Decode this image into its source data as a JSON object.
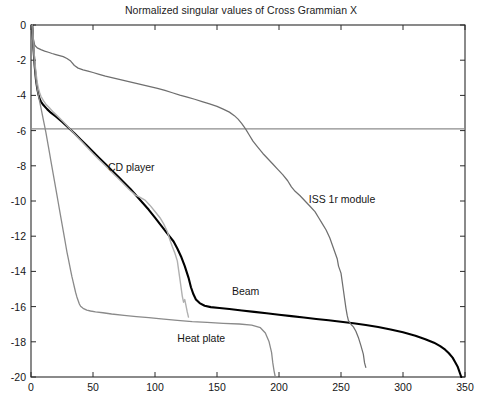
{
  "chart_data": {
    "type": "line",
    "title": "Normalized singular values of Cross Grammian  X",
    "xlabel": "",
    "ylabel": "",
    "xlim": [
      0,
      350
    ],
    "ylim": [
      -20,
      0
    ],
    "xticks": [
      0,
      50,
      100,
      150,
      200,
      250,
      300,
      350
    ],
    "yticks": [
      0,
      -2,
      -4,
      -6,
      -8,
      -10,
      -12,
      -14,
      -16,
      -18,
      -20
    ],
    "xtick_labels": [
      "0",
      "50",
      "100",
      "150",
      "200",
      "250",
      "300",
      "350"
    ],
    "ytick_labels": [
      "0",
      "-2",
      "-4",
      "-6",
      "-8",
      "-10",
      "-12",
      "-14",
      "-16",
      "-18",
      "-20"
    ],
    "grid": false,
    "legend_position": "inline-annotations",
    "annotations": [
      {
        "text": "CD player",
        "x": 62,
        "y": -8.1,
        "series": "CD player"
      },
      {
        "text": "ISS 1r module",
        "x": 224,
        "y": -9.95,
        "series": "ISS 1r module"
      },
      {
        "text": "Beam",
        "x": 162,
        "y": -15.15,
        "series": "Beam"
      },
      {
        "text": "Heat plate",
        "x": 118,
        "y": -17.85,
        "series": "Heat plate"
      }
    ],
    "reference_line": {
      "orientation": "horizontal",
      "y": -5.9,
      "color": "#8c8c8c",
      "width": 1.1
    },
    "series": [
      {
        "name": "Beam",
        "color": "#000000",
        "width": 2.1,
        "points": [
          [
            1,
            0
          ],
          [
            2,
            -1.35
          ],
          [
            3,
            -2.35
          ],
          [
            4,
            -3.1
          ],
          [
            5,
            -3.6
          ],
          [
            6,
            -3.95
          ],
          [
            7,
            -4.2
          ],
          [
            8,
            -4.35
          ],
          [
            10,
            -4.55
          ],
          [
            13,
            -4.78
          ],
          [
            16,
            -4.98
          ],
          [
            20,
            -5.2
          ],
          [
            25,
            -5.5
          ],
          [
            30,
            -5.82
          ],
          [
            35,
            -6.15
          ],
          [
            40,
            -6.5
          ],
          [
            45,
            -6.85
          ],
          [
            50,
            -7.2
          ],
          [
            55,
            -7.55
          ],
          [
            60,
            -7.9
          ],
          [
            65,
            -8.25
          ],
          [
            70,
            -8.6
          ],
          [
            75,
            -8.95
          ],
          [
            80,
            -9.3
          ],
          [
            85,
            -9.7
          ],
          [
            90,
            -10.1
          ],
          [
            95,
            -10.5
          ],
          [
            100,
            -10.95
          ],
          [
            105,
            -11.4
          ],
          [
            110,
            -11.85
          ],
          [
            115,
            -12.3
          ],
          [
            118,
            -12.7
          ],
          [
            121,
            -13.15
          ],
          [
            124,
            -13.7
          ],
          [
            127,
            -14.35
          ],
          [
            129,
            -14.9
          ],
          [
            131,
            -15.3
          ],
          [
            133,
            -15.6
          ],
          [
            136,
            -15.8
          ],
          [
            140,
            -15.95
          ],
          [
            145,
            -16.03
          ],
          [
            152,
            -16.08
          ],
          [
            160,
            -16.14
          ],
          [
            170,
            -16.22
          ],
          [
            180,
            -16.3
          ],
          [
            190,
            -16.38
          ],
          [
            200,
            -16.46
          ],
          [
            210,
            -16.54
          ],
          [
            220,
            -16.62
          ],
          [
            230,
            -16.7
          ],
          [
            240,
            -16.78
          ],
          [
            250,
            -16.86
          ],
          [
            260,
            -16.95
          ],
          [
            270,
            -17.05
          ],
          [
            280,
            -17.16
          ],
          [
            290,
            -17.3
          ],
          [
            300,
            -17.46
          ],
          [
            310,
            -17.65
          ],
          [
            318,
            -17.85
          ],
          [
            325,
            -18.05
          ],
          [
            330,
            -18.25
          ],
          [
            334,
            -18.45
          ],
          [
            337,
            -18.65
          ],
          [
            340,
            -18.9
          ],
          [
            342,
            -19.15
          ],
          [
            344,
            -19.4
          ],
          [
            345,
            -19.6
          ],
          [
            346,
            -19.8
          ],
          [
            347,
            -20
          ]
        ]
      },
      {
        "name": "ISS 1r module",
        "color": "#6f6f6f",
        "width": 1.25,
        "points": [
          [
            1,
            0
          ],
          [
            2,
            -0.85
          ],
          [
            3,
            -1.15
          ],
          [
            5,
            -1.3
          ],
          [
            8,
            -1.4
          ],
          [
            11,
            -1.48
          ],
          [
            14,
            -1.55
          ],
          [
            17,
            -1.62
          ],
          [
            20,
            -1.68
          ],
          [
            23,
            -1.74
          ],
          [
            26,
            -1.8
          ],
          [
            29,
            -1.9
          ],
          [
            32,
            -2.05
          ],
          [
            35,
            -2.3
          ],
          [
            38,
            -2.45
          ],
          [
            42,
            -2.55
          ],
          [
            46,
            -2.62
          ],
          [
            50,
            -2.7
          ],
          [
            55,
            -2.8
          ],
          [
            60,
            -2.9
          ],
          [
            66,
            -3.0
          ],
          [
            72,
            -3.1
          ],
          [
            78,
            -3.2
          ],
          [
            84,
            -3.3
          ],
          [
            90,
            -3.4
          ],
          [
            96,
            -3.5
          ],
          [
            102,
            -3.6
          ],
          [
            108,
            -3.72
          ],
          [
            114,
            -3.85
          ],
          [
            120,
            -3.98
          ],
          [
            126,
            -4.1
          ],
          [
            132,
            -4.22
          ],
          [
            138,
            -4.35
          ],
          [
            144,
            -4.48
          ],
          [
            150,
            -4.62
          ],
          [
            155,
            -4.78
          ],
          [
            160,
            -4.95
          ],
          [
            164,
            -5.15
          ],
          [
            167,
            -5.35
          ],
          [
            170,
            -5.6
          ],
          [
            173,
            -5.9
          ],
          [
            176,
            -6.25
          ],
          [
            179,
            -6.6
          ],
          [
            183,
            -6.95
          ],
          [
            187,
            -7.3
          ],
          [
            191,
            -7.6
          ],
          [
            195,
            -7.9
          ],
          [
            199,
            -8.2
          ],
          [
            203,
            -8.5
          ],
          [
            207,
            -8.85
          ],
          [
            210,
            -9.2
          ],
          [
            213,
            -9.45
          ],
          [
            217,
            -9.7
          ],
          [
            221,
            -10.0
          ],
          [
            225,
            -10.3
          ],
          [
            229,
            -10.6
          ],
          [
            232,
            -10.95
          ],
          [
            235,
            -11.3
          ],
          [
            238,
            -11.65
          ],
          [
            241,
            -12.1
          ],
          [
            243,
            -12.5
          ],
          [
            245,
            -12.9
          ],
          [
            247,
            -13.3
          ],
          [
            248,
            -13.7
          ],
          [
            250,
            -14.1
          ],
          [
            251,
            -14.6
          ],
          [
            252,
            -15.1
          ],
          [
            253,
            -15.6
          ],
          [
            254,
            -16.1
          ],
          [
            255,
            -16.5
          ],
          [
            256,
            -16.8
          ],
          [
            258,
            -17.0
          ],
          [
            260,
            -17.15
          ],
          [
            262,
            -17.4
          ],
          [
            264,
            -17.75
          ],
          [
            266,
            -18.2
          ],
          [
            268,
            -18.7
          ],
          [
            269,
            -19.2
          ],
          [
            270,
            -19.45
          ]
        ]
      },
      {
        "name": "CD player",
        "color": "#b0b0b0",
        "width": 1.4,
        "points": [
          [
            1,
            0
          ],
          [
            2,
            -1.1
          ],
          [
            3,
            -2.0
          ],
          [
            4,
            -2.7
          ],
          [
            5,
            -3.25
          ],
          [
            6,
            -3.6
          ],
          [
            7,
            -3.85
          ],
          [
            8,
            -4.05
          ],
          [
            10,
            -4.3
          ],
          [
            12,
            -4.5
          ],
          [
            15,
            -4.72
          ],
          [
            18,
            -4.95
          ],
          [
            22,
            -5.22
          ],
          [
            26,
            -5.5
          ],
          [
            30,
            -5.8
          ],
          [
            34,
            -6.1
          ],
          [
            38,
            -6.4
          ],
          [
            42,
            -6.7
          ],
          [
            46,
            -7.0
          ],
          [
            50,
            -7.3
          ],
          [
            55,
            -7.65
          ],
          [
            60,
            -8.0
          ],
          [
            65,
            -8.35
          ],
          [
            70,
            -8.7
          ],
          [
            75,
            -9.05
          ],
          [
            80,
            -9.4
          ],
          [
            84,
            -9.65
          ],
          [
            88,
            -9.8
          ],
          [
            92,
            -9.95
          ],
          [
            96,
            -10.25
          ],
          [
            100,
            -10.6
          ],
          [
            104,
            -10.95
          ],
          [
            107,
            -11.3
          ],
          [
            110,
            -11.75
          ],
          [
            112,
            -12.2
          ],
          [
            114,
            -12.6
          ],
          [
            116,
            -12.95
          ],
          [
            118,
            -13.4
          ],
          [
            119,
            -13.9
          ],
          [
            120,
            -14.4
          ],
          [
            121,
            -14.9
          ],
          [
            122,
            -15.4
          ],
          [
            123,
            -15.75
          ],
          [
            124,
            -15.6
          ],
          [
            125,
            -15.95
          ],
          [
            126,
            -16.3
          ],
          [
            127,
            -16.6
          ]
        ]
      },
      {
        "name": "Heat plate",
        "color": "#8a8a8a",
        "width": 1.3,
        "points": [
          [
            1,
            0
          ],
          [
            2,
            -1.4
          ],
          [
            3,
            -2.4
          ],
          [
            4,
            -3.1
          ],
          [
            5,
            -3.6
          ],
          [
            6,
            -4.0
          ],
          [
            7,
            -4.35
          ],
          [
            8,
            -4.7
          ],
          [
            9,
            -5.05
          ],
          [
            10,
            -5.4
          ],
          [
            11,
            -5.75
          ],
          [
            12,
            -6.1
          ],
          [
            13,
            -6.5
          ],
          [
            14,
            -6.9
          ],
          [
            15,
            -7.3
          ],
          [
            16,
            -7.7
          ],
          [
            17,
            -8.1
          ],
          [
            18,
            -8.5
          ],
          [
            19,
            -8.9
          ],
          [
            20,
            -9.3
          ],
          [
            21,
            -9.7
          ],
          [
            22,
            -10.1
          ],
          [
            23,
            -10.5
          ],
          [
            24,
            -10.9
          ],
          [
            25,
            -11.3
          ],
          [
            26,
            -11.7
          ],
          [
            27,
            -12.1
          ],
          [
            28,
            -12.5
          ],
          [
            29,
            -12.9
          ],
          [
            30,
            -13.25
          ],
          [
            31,
            -13.6
          ],
          [
            32,
            -13.95
          ],
          [
            33,
            -14.3
          ],
          [
            34,
            -14.6
          ],
          [
            35,
            -14.9
          ],
          [
            36,
            -15.2
          ],
          [
            37,
            -15.45
          ],
          [
            38,
            -15.65
          ],
          [
            39,
            -15.85
          ],
          [
            40,
            -15.98
          ],
          [
            42,
            -16.1
          ],
          [
            45,
            -16.2
          ],
          [
            48,
            -16.25
          ],
          [
            52,
            -16.3
          ],
          [
            58,
            -16.35
          ],
          [
            65,
            -16.42
          ],
          [
            75,
            -16.5
          ],
          [
            85,
            -16.57
          ],
          [
            95,
            -16.63
          ],
          [
            105,
            -16.7
          ],
          [
            118,
            -16.78
          ],
          [
            130,
            -16.85
          ],
          [
            142,
            -16.9
          ],
          [
            155,
            -16.95
          ],
          [
            168,
            -16.99
          ],
          [
            178,
            -17.05
          ],
          [
            185,
            -17.2
          ],
          [
            189,
            -17.5
          ],
          [
            192,
            -18.0
          ],
          [
            194,
            -18.6
          ],
          [
            195,
            -19.2
          ],
          [
            196,
            -19.65
          ],
          [
            197,
            -20
          ]
        ]
      }
    ]
  },
  "axes_geometry": {
    "left_px": 31,
    "right_px": 465,
    "top_px": 25,
    "bottom_px": 377,
    "frame_color": "#2a2a2a"
  }
}
